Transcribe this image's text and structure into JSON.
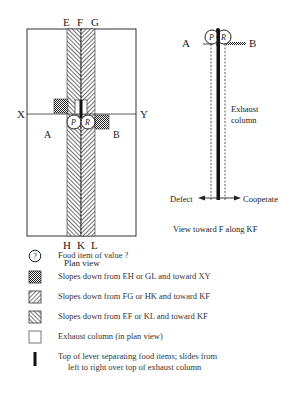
{
  "plan_view": {
    "top_labels": [
      "E",
      "F",
      "G"
    ],
    "bottom_labels": [
      "H",
      "K",
      "L"
    ],
    "left_axis_label": "X",
    "right_axis_label": "Y",
    "region_left": "A",
    "region_right": "B",
    "food_items": [
      "P",
      "R"
    ],
    "caption": "Plan view"
  },
  "side_view": {
    "left_label": "A",
    "right_label": "B",
    "food_items": [
      "P",
      "R"
    ],
    "column_label_line1": "Exhaust",
    "column_label_line2": "column",
    "arrow_left_label": "Defect",
    "arrow_right_label": "Cooperate",
    "caption": "View toward F along KF"
  },
  "legend": {
    "items": [
      {
        "icon": "food-item-icon",
        "symbol": "?",
        "label": "Food item of value ?"
      },
      {
        "icon": "crosshatch-swatch-icon",
        "label": "Slopes down from EH or GL and toward XY"
      },
      {
        "icon": "forward-diagonal-swatch-icon",
        "label": "Slopes down from FG or HK and toward KF"
      },
      {
        "icon": "back-diagonal-swatch-icon",
        "label": "Slopes down from EF or KL and toward KF"
      },
      {
        "icon": "empty-box-icon",
        "label": "Exhaust column (in plan view)"
      },
      {
        "icon": "lever-bar-icon",
        "label_line1": "Top of lever separating food items; slides from",
        "label_line2": "left to right over top of exhaust column"
      }
    ]
  },
  "colors": {
    "line": "#222222",
    "hatch": "#444444",
    "background": "#ffffff"
  }
}
